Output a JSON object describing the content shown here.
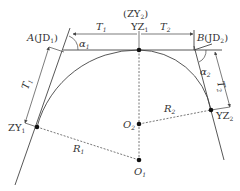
{
  "diagram": {
    "type": "compound circular curve",
    "labels": {
      "A": "A",
      "A_jd": "JD",
      "A_jd_sub": "1",
      "B": "B",
      "B_jd": "JD",
      "B_jd_sub": "2",
      "zy2_top": "ZY",
      "zy2_top_sub": "2",
      "yz1": "YZ",
      "yz1_sub": "1",
      "T1_top": "T",
      "T1_top_sub": "1",
      "T2_top": "T",
      "T2_top_sub": "2",
      "T1_side": "T",
      "T1_side_sub": "1",
      "T2_side": "T",
      "T2_side_sub": "2",
      "alpha1": "α",
      "alpha1_sub": "1",
      "alpha2": "α",
      "alpha2_sub": "2",
      "zy1": "ZY",
      "zy1_sub": "1",
      "yz2": "YZ",
      "yz2_sub": "2",
      "R1": "R",
      "R1_sub": "1",
      "R2": "R",
      "R2_sub": "2",
      "O1": "O",
      "O1_sub": "1",
      "O2": "O",
      "O2_sub": "2"
    },
    "colors": {
      "line": "#444444",
      "text": "#333333",
      "point": "#111111"
    }
  }
}
